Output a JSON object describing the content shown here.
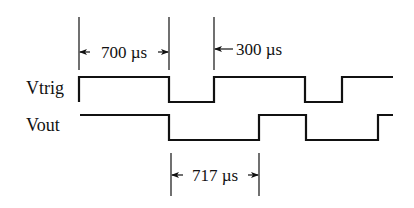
{
  "signals": [
    {
      "name": "Vtrig",
      "label": "Vtrig",
      "high_y": 77,
      "low_y": 102,
      "edges_x": [
        79,
        169,
        214,
        305,
        342
      ],
      "start_level": "high",
      "end_x": 393
    },
    {
      "name": "Vout",
      "label": "Vout",
      "high_y": 115,
      "low_y": 140,
      "edges_x": [
        169,
        259,
        306,
        378
      ],
      "start_level": "high",
      "start_x": 80,
      "end_x": 393
    }
  ],
  "annotations": {
    "t700": {
      "text": "700 µs",
      "x1": 79,
      "x2": 169,
      "y": 52
    },
    "t300": {
      "text": "300 µs",
      "x": 214,
      "y": 52
    },
    "t717": {
      "text": "717 µs",
      "x1": 171,
      "x2": 259,
      "y": 174
    }
  },
  "colors": {
    "line": "#111111",
    "background": "#ffffff"
  }
}
